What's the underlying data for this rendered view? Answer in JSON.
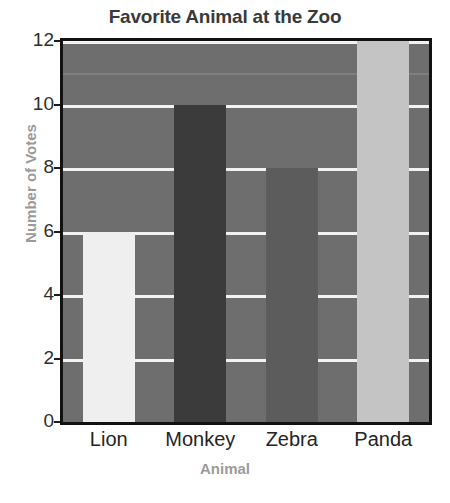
{
  "chart_data": {
    "type": "bar",
    "title": "Favorite Animal at the Zoo",
    "xlabel": "Animal",
    "ylabel": "Number of Votes",
    "categories": [
      "Lion",
      "Monkey",
      "Zebra",
      "Panda"
    ],
    "values": [
      6,
      10,
      8,
      12
    ],
    "ylim": [
      0,
      12
    ],
    "yticks": [
      0,
      2,
      4,
      6,
      8,
      10,
      12
    ],
    "ytick_labels": [
      "0",
      "2",
      "4",
      "6",
      "8",
      "10",
      "12"
    ],
    "grid": true,
    "grid_color": "#f2f2f2",
    "legend": null,
    "plot_background": "#6e6e6e",
    "bar_colors": [
      "#efefef",
      "#3b3b3b",
      "#5c5c5c",
      "#c4c4c4"
    ],
    "bars": [
      {
        "label": "Lion",
        "value": 6,
        "color": "#efefef"
      },
      {
        "label": "Monkey",
        "value": 10,
        "color": "#3b3b3b"
      },
      {
        "label": "Zebra",
        "value": 8,
        "color": "#5c5c5c"
      },
      {
        "label": "Panda",
        "value": 12,
        "color": "#c4c4c4"
      }
    ]
  },
  "axis_title_color": "#9a9a9a",
  "title_color": "#3a3a3a"
}
